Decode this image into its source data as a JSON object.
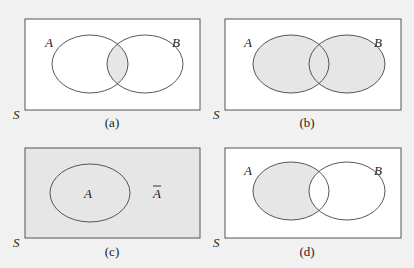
{
  "colors": {
    "page_background": "#f1f1f1",
    "panel_background": "#ffffff",
    "shaded": "#e6e6e6",
    "stroke": "#444444"
  },
  "panels": [
    {
      "id": "a",
      "caption": "(a)",
      "universe_label": "S",
      "set_labels": [
        "A",
        "B"
      ],
      "shaded_region": "A ∩ B"
    },
    {
      "id": "b",
      "caption": "(b)",
      "universe_label": "S",
      "set_labels": [
        "A",
        "B"
      ],
      "shaded_region": "A ∪ B"
    },
    {
      "id": "c",
      "caption": "(c)",
      "universe_label": "S",
      "set_labels": [
        "A"
      ],
      "complement_label": "Ā",
      "complement_base": "A",
      "shaded_region": "complement of A"
    },
    {
      "id": "d",
      "caption": "(d)",
      "universe_label": "S",
      "set_labels": [
        "A",
        "B"
      ],
      "shaded_region": "A − B"
    }
  ]
}
